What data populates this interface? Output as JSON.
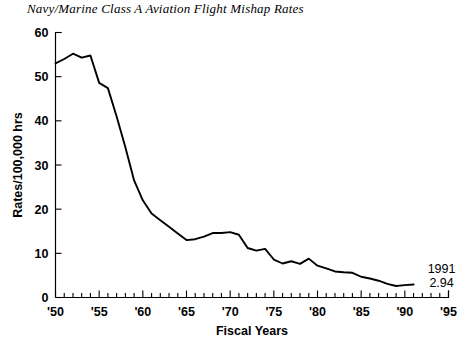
{
  "chart_data": {
    "type": "line",
    "title": "Navy/Marine Class A Aviation Flight Mishap Rates",
    "xlabel": "Fiscal Years",
    "ylabel": "Rates/100,000 hrs",
    "xlim": [
      1950,
      1995
    ],
    "ylim": [
      0,
      60
    ],
    "y_ticks": [
      0,
      10,
      20,
      30,
      40,
      50,
      60
    ],
    "y_tick_labels": [
      "0",
      "10",
      "20",
      "30",
      "40",
      "50",
      "60"
    ],
    "x_ticks": [
      1950,
      1955,
      1960,
      1965,
      1970,
      1975,
      1980,
      1985,
      1990,
      1995
    ],
    "x_tick_labels": [
      "'50",
      "'55",
      "'60",
      "'65",
      "'70",
      "'75",
      "'80",
      "'85",
      "'90",
      "'95"
    ],
    "x_minor_tick_step": 1,
    "grid": false,
    "legend": false,
    "line_color": "#000000",
    "x": [
      1950,
      1951,
      1952,
      1953,
      1954,
      1955,
      1956,
      1957,
      1958,
      1959,
      1960,
      1961,
      1962,
      1963,
      1964,
      1965,
      1966,
      1967,
      1968,
      1969,
      1970,
      1971,
      1972,
      1973,
      1974,
      1975,
      1976,
      1977,
      1978,
      1979,
      1980,
      1981,
      1982,
      1983,
      1984,
      1985,
      1986,
      1987,
      1988,
      1989,
      1990,
      1991
    ],
    "values": [
      53.0,
      54.0,
      55.2,
      54.3,
      54.8,
      48.6,
      47.4,
      41.0,
      34.0,
      26.5,
      22.0,
      19.0,
      17.5,
      16.0,
      14.5,
      13.0,
      13.2,
      13.8,
      14.6,
      14.6,
      14.8,
      14.2,
      11.2,
      10.6,
      11.0,
      8.6,
      7.7,
      8.2,
      7.6,
      8.8,
      7.2,
      6.6,
      5.9,
      5.7,
      5.6,
      4.7,
      4.3,
      3.8,
      3.1,
      2.6,
      2.8,
      2.94
    ],
    "annotations": [
      {
        "name": "end-point-year",
        "text": "1991",
        "x": 1991,
        "y": 2.94
      },
      {
        "name": "end-point-value",
        "text": "2.94",
        "x": 1991,
        "y": 2.94
      }
    ]
  }
}
